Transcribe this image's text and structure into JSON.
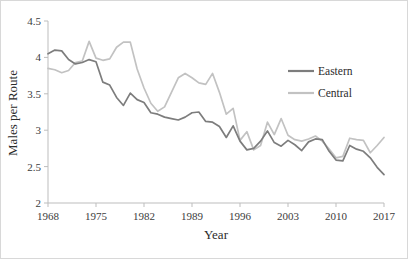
{
  "chart_data": {
    "type": "line",
    "title": "",
    "xlabel": "Year",
    "ylabel": "Males per Route",
    "xlim": [
      1968,
      2017
    ],
    "ylim": [
      2,
      4.5
    ],
    "ytick_labels": [
      "4.5",
      "4",
      "3.5",
      "3",
      "2.5",
      "2"
    ],
    "ytick_values": [
      4.5,
      4,
      3.5,
      3,
      2.5,
      2
    ],
    "xtick_labels": [
      "1968",
      "1975",
      "1982",
      "1989",
      "1996",
      "2003",
      "2010",
      "2017"
    ],
    "xtick_values": [
      1968,
      1975,
      1982,
      1989,
      1996,
      2003,
      2010,
      2017
    ],
    "grid": false,
    "legend_position": "top-right",
    "x": [
      1968,
      1969,
      1970,
      1971,
      1972,
      1973,
      1974,
      1975,
      1976,
      1977,
      1978,
      1979,
      1980,
      1981,
      1982,
      1983,
      1984,
      1985,
      1986,
      1987,
      1988,
      1989,
      1990,
      1991,
      1992,
      1993,
      1994,
      1995,
      1996,
      1997,
      1998,
      1999,
      2000,
      2001,
      2002,
      2003,
      2004,
      2005,
      2006,
      2007,
      2008,
      2009,
      2010,
      2011,
      2012,
      2013,
      2014,
      2015,
      2016,
      2017
    ],
    "series": [
      {
        "name": "Eastern",
        "color": "#7d7d7d",
        "values": [
          4.05,
          4.1,
          4.09,
          3.97,
          3.91,
          3.93,
          3.97,
          3.94,
          3.66,
          3.62,
          3.45,
          3.34,
          3.51,
          3.42,
          3.38,
          3.24,
          3.22,
          3.18,
          3.16,
          3.14,
          3.18,
          3.24,
          3.25,
          3.12,
          3.11,
          3.05,
          2.9,
          3.06,
          2.85,
          2.73,
          2.75,
          2.85,
          2.99,
          2.83,
          2.78,
          2.86,
          2.8,
          2.72,
          2.84,
          2.88,
          2.87,
          2.71,
          2.59,
          2.58,
          2.79,
          2.74,
          2.71,
          2.62,
          2.49,
          2.39
        ]
      },
      {
        "name": "Central",
        "color": "#c2c2c2",
        "values": [
          3.85,
          3.83,
          3.79,
          3.82,
          3.93,
          3.95,
          4.22,
          3.99,
          3.96,
          3.98,
          4.14,
          4.21,
          4.21,
          3.84,
          3.58,
          3.37,
          3.26,
          3.32,
          3.52,
          3.72,
          3.78,
          3.72,
          3.65,
          3.63,
          3.78,
          3.52,
          3.22,
          3.3,
          2.86,
          2.98,
          2.73,
          2.79,
          3.11,
          2.94,
          3.16,
          2.93,
          2.87,
          2.85,
          2.88,
          2.92,
          2.85,
          2.74,
          2.62,
          2.64,
          2.89,
          2.87,
          2.86,
          2.69,
          2.79,
          2.9
        ]
      }
    ]
  },
  "legend": {
    "items": [
      {
        "label": "Eastern",
        "color": "#7d7d7d"
      },
      {
        "label": "Central",
        "color": "#c2c2c2"
      }
    ]
  }
}
